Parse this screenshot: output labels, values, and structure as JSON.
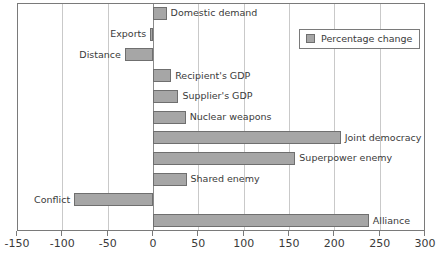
{
  "chart_data": {
    "type": "bar",
    "orientation": "horizontal",
    "title": "",
    "subtitle": "",
    "xlabel": "",
    "ylabel": "",
    "xlim": [
      -150,
      300
    ],
    "xticks": [
      -150,
      -100,
      -50,
      0,
      50,
      100,
      150,
      200,
      250,
      300
    ],
    "xticklabels": [
      "-150",
      "-100",
      "-50",
      "0",
      "50",
      "100",
      "150",
      "200",
      "250",
      "300"
    ],
    "grid": "vertical",
    "legend": {
      "position": "top-right",
      "entries": [
        {
          "label": "Percentage change",
          "color": "#a6a6a6"
        }
      ]
    },
    "series": [
      {
        "name": "Percentage change",
        "color": "#a6a6a6",
        "edge_color": "#6f6f6f"
      }
    ],
    "categories": [
      "Domestic demand",
      "Exports",
      "Distance",
      "Recipient's GDP",
      "Supplier's GDP",
      "Nuclear weapons",
      "Joint democracy",
      "Superpower enemy",
      "Shared enemy",
      "Conflict",
      "Alliance"
    ],
    "values": [
      15,
      -3,
      -31,
      20,
      28,
      36,
      207,
      157,
      37,
      -87,
      238
    ],
    "bars": [
      {
        "label": "Domestic demand",
        "value": 15,
        "label_side": "right"
      },
      {
        "label": "Exports",
        "value": -3,
        "label_side": "left"
      },
      {
        "label": "Distance",
        "value": -31,
        "label_side": "left"
      },
      {
        "label": "Recipient's GDP",
        "value": 20,
        "label_side": "right"
      },
      {
        "label": "Supplier's GDP",
        "value": 28,
        "label_side": "right"
      },
      {
        "label": "Nuclear weapons",
        "value": 36,
        "label_side": "right"
      },
      {
        "label": "Joint democracy",
        "value": 207,
        "label_side": "right"
      },
      {
        "label": "Superpower enemy",
        "value": 157,
        "label_side": "right"
      },
      {
        "label": "Shared enemy",
        "value": 37,
        "label_side": "right"
      },
      {
        "label": "Conflict",
        "value": -87,
        "label_side": "left"
      },
      {
        "label": "Alliance",
        "value": 238,
        "label_side": "right"
      }
    ]
  },
  "colors": {
    "bar_fill": "#a6a6a6",
    "bar_edge": "#6f6f6f",
    "frame": "#7a7a7a",
    "gridline": "#c9c9c9",
    "zero_line": "#8a8a8a",
    "text": "#3a3a3a",
    "background": "#ffffff"
  }
}
